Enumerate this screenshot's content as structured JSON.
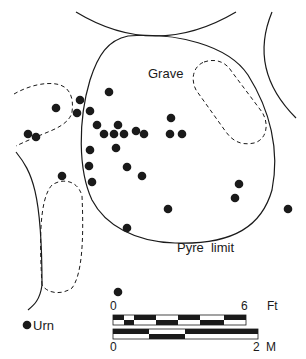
{
  "labels": {
    "grave": "Grave",
    "pyre_limit": "Pyre  limit",
    "legend_urn": "Urn"
  },
  "scale_bar": {
    "feet": {
      "start": "0",
      "end": "6",
      "unit": "Ft"
    },
    "metres": {
      "start": "0",
      "end": "2",
      "unit": "M"
    }
  },
  "colors": {
    "ink": "#1a1a1a",
    "background": "#ffffff"
  },
  "urns": [
    [
      56,
      108
    ],
    [
      80,
      100
    ],
    [
      77,
      113
    ],
    [
      90,
      111
    ],
    [
      109,
      92
    ],
    [
      28,
      134
    ],
    [
      36,
      137
    ],
    [
      97,
      125
    ],
    [
      118,
      125
    ],
    [
      104,
      134
    ],
    [
      114,
      134
    ],
    [
      124,
      134
    ],
    [
      136,
      131
    ],
    [
      144,
      134
    ],
    [
      171,
      118
    ],
    [
      170,
      134
    ],
    [
      182,
      134
    ],
    [
      90,
      150
    ],
    [
      116,
      148
    ],
    [
      89,
      166
    ],
    [
      127,
      167
    ],
    [
      92,
      182
    ],
    [
      142,
      176
    ],
    [
      62,
      176
    ],
    [
      168,
      209
    ],
    [
      127,
      228
    ],
    [
      239,
      184
    ],
    [
      235,
      198
    ],
    [
      288,
      209
    ],
    [
      118,
      292
    ]
  ]
}
